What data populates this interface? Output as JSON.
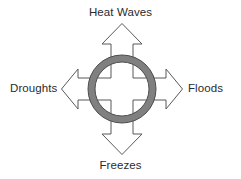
{
  "diagram": {
    "type": "radial-arrow-diagram",
    "background_color": "#ffffff",
    "center": {
      "shape": "ring",
      "fill_color": "#808080",
      "stroke_color": "#4d4d4d",
      "cx": 122,
      "cy": 89,
      "outer_radius": 34,
      "inner_radius": 27
    },
    "arrows": {
      "fill_color": "#ffffff",
      "stroke_color": "#595959",
      "stroke_width": 1,
      "count": 4
    },
    "labels": {
      "top": "Heat Waves",
      "right": "Floods",
      "bottom": "Freezes",
      "left": "Droughts"
    },
    "label_color": "#2b2b2b"
  }
}
